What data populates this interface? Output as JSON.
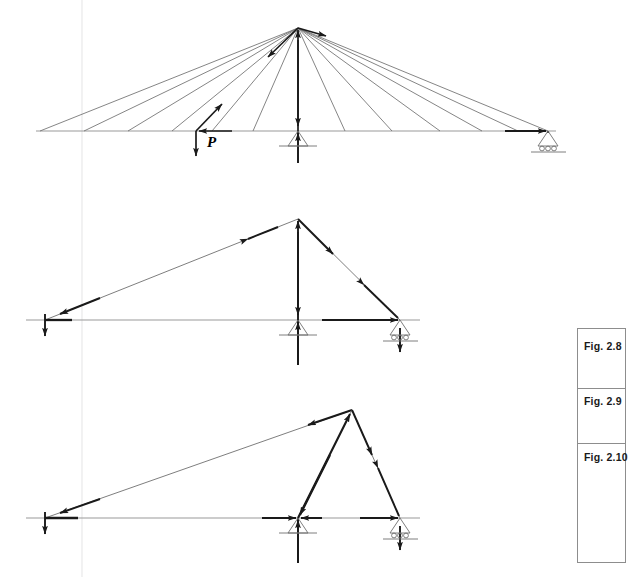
{
  "page": {
    "width": 626,
    "height": 577,
    "background": "#ffffff",
    "ink": "#1a1a1a",
    "thin_line": "#8a8a8a"
  },
  "labels": {
    "load_p": "P",
    "fig_1": "Fig. 2.8",
    "fig_2": "Fig. 2.9",
    "fig_3": "Fig. 2.10"
  },
  "figures": [
    {
      "id": "fig-2-8",
      "caption": "Fig. 2.8",
      "description": "Cable-stayed structure: fan of stay cables from apex to deck, point load P applied left of centre, pin support at centre, roller support at right end",
      "apex": {
        "x": 298,
        "y": 28
      },
      "deck_y": 131,
      "deck_left_x": 36,
      "deck_right_x": 556,
      "supports": [
        {
          "type": "pin",
          "x": 298,
          "y": 131
        },
        {
          "type": "roller",
          "x": 548,
          "y": 131
        }
      ],
      "load": {
        "x": 196,
        "y": 131,
        "label": "P",
        "direction": "down"
      },
      "stay_count": 12
    },
    {
      "id": "fig-2-9",
      "caption": "Fig. 2.9",
      "description": "Equivalent triangular frame: single stay from left end to apex, strut down to right support, vertical tie at centre pin support",
      "apex": {
        "x": 298,
        "y": 219
      },
      "deck_y": 320,
      "deck_left_x": 26,
      "deck_right_x": 420,
      "left_node": {
        "x": 45,
        "y": 320
      },
      "supports": [
        {
          "type": "pin",
          "x": 298,
          "y": 320
        },
        {
          "type": "roller",
          "x": 400,
          "y": 320
        }
      ]
    },
    {
      "id": "fig-2-10",
      "caption": "Fig. 2.10",
      "description": "Triangular frame with apex shifted toward the right support: long tie from left end to apex, inclined strut down to centre pin, short strut to right roller",
      "apex": {
        "x": 352,
        "y": 410
      },
      "deck_y": 518,
      "deck_left_x": 26,
      "deck_right_x": 420,
      "left_node": {
        "x": 45,
        "y": 518
      },
      "supports": [
        {
          "type": "pin",
          "x": 298,
          "y": 518
        },
        {
          "type": "roller",
          "x": 400,
          "y": 518
        }
      ]
    }
  ],
  "caption_box": {
    "x": 577,
    "y": 328,
    "width": 49,
    "height": 235,
    "rows": [
      {
        "label": "Fig. 2.8",
        "y": 328,
        "height": 60
      },
      {
        "label": "Fig. 2.9",
        "y": 388,
        "height": 55
      },
      {
        "label": "Fig. 2.10",
        "y": 443,
        "height": 120
      }
    ]
  }
}
